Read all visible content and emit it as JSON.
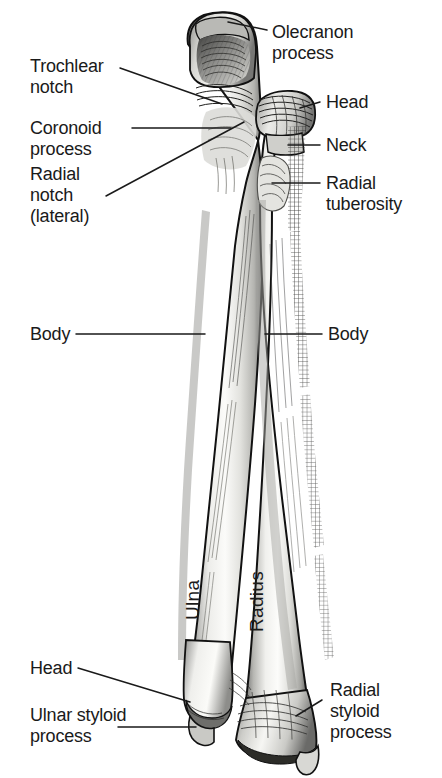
{
  "figure": {
    "background_color": "#ffffff",
    "text_color": "#1a1a1a",
    "leader_color": "#1a1a1a",
    "bone_fill_light": "#f7f7f5",
    "bone_fill_mid": "#d9d9d6",
    "bone_fill_dark": "#8e8e8c",
    "outline_color": "#111111"
  },
  "labels": {
    "olecranon_process": "Olecranon\nprocess",
    "trochlear_notch": "Trochlear\nnotch",
    "coronoid_process": "Coronoid\nprocess",
    "radial_notch_lateral": "Radial\nnotch\n(lateral)",
    "head_right": "Head",
    "neck": "Neck",
    "radial_tuberosity": "Radial\ntuberosity",
    "body_left": "Body",
    "body_right": "Body",
    "head_left": "Head",
    "ulnar_styloid_process": "Ulnar styloid\nprocess",
    "radial_styloid_process": "Radial\nstyloid\nprocess"
  },
  "bone_names": {
    "ulna": "Ulna",
    "radius": "Radius"
  }
}
